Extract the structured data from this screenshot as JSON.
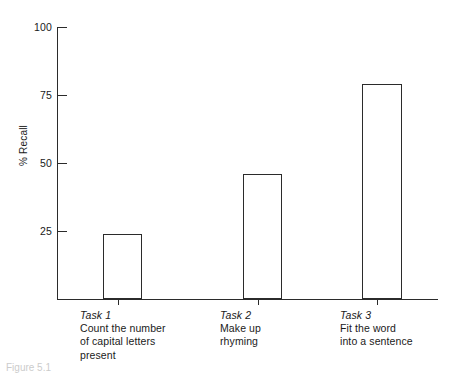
{
  "chart_data": {
    "type": "bar",
    "title": "",
    "xlabel": "",
    "ylabel": "% Recall",
    "ylim": [
      0,
      100
    ],
    "yticks": [
      25,
      50,
      75,
      100
    ],
    "ytick_labels": [
      "25",
      "50",
      "75",
      "100"
    ],
    "grid": false,
    "legend": false,
    "categories": [
      "Task 1",
      "Task 2",
      "Task 3"
    ],
    "category_descriptions": [
      "Count the number\nof capital letters\npresent",
      "Make up\nrhyming",
      "Fit the word\ninto a sentence"
    ],
    "values": [
      24,
      46,
      79
    ],
    "bar_style": {
      "fill": "#ffffff",
      "edge": "#2b2b2b"
    }
  },
  "axes": {
    "y_title": "% Recall",
    "ticks": [
      {
        "label": "100",
        "value": 100
      },
      {
        "label": "75",
        "value": 75
      },
      {
        "label": "50",
        "value": 50
      },
      {
        "label": "25",
        "value": 25
      }
    ]
  },
  "bars": [
    {
      "title": "Task 1",
      "description": "Count the number\nof capital letters\npresent",
      "value": 24
    },
    {
      "title": "Task 2",
      "description": "Make up\nrhyming",
      "value": 46
    },
    {
      "title": "Task 3",
      "description": "Fit the word\ninto a sentence",
      "value": 79
    }
  ],
  "caption": "Figure 5.1"
}
